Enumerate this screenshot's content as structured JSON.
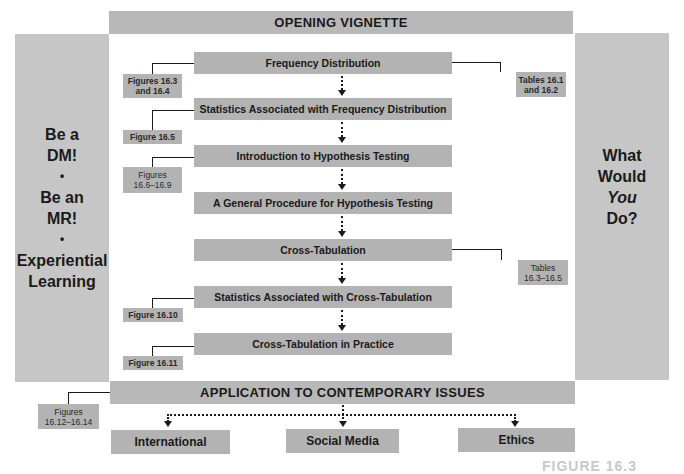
{
  "header": {
    "title": "OPENING VIGNETTE"
  },
  "left_panel": {
    "lines": [
      "Be a",
      "DM!",
      "•",
      "Be an",
      "MR!",
      "•",
      "Experiential",
      "Learning"
    ]
  },
  "right_panel": {
    "lines": [
      "What",
      "Would",
      "You",
      "Do?"
    ],
    "italic_index": 2
  },
  "flow": {
    "steps": [
      "Frequency Distribution",
      "Statistics Associated with Frequency Distribution",
      "Introduction to Hypothesis Testing",
      "A General Procedure for Hypothesis Testing",
      "Cross-Tabulation",
      "Statistics Associated with Cross-Tabulation",
      "Cross-Tabulation in Practice"
    ]
  },
  "references": {
    "figures_16_3_16_4": "Figures 16.3\nand 16.4",
    "tables_16_1_16_2": "Tables 16.1\nand 16.2",
    "figure_16_5": "Figure 16.5",
    "figures_16_6_16_9": "Figures\n16.6–16.9",
    "tables_16_3_16_5": "Tables\n16.3–16.5",
    "figure_16_10": "Figure 16.10",
    "figure_16_11": "Figure 16.11",
    "figures_16_12_16_14": "Figures\n16.12–16.14"
  },
  "footer": {
    "title": "APPLICATION TO CONTEMPORARY ISSUES",
    "branches": [
      "International",
      "Social Media",
      "Ethics"
    ]
  },
  "caption": {
    "text": "FIGURE 16.3"
  },
  "colors": {
    "bar_gray": "#b3b3b3",
    "panel_gray": "#c6c6c6",
    "text": "#1a1a1a"
  }
}
